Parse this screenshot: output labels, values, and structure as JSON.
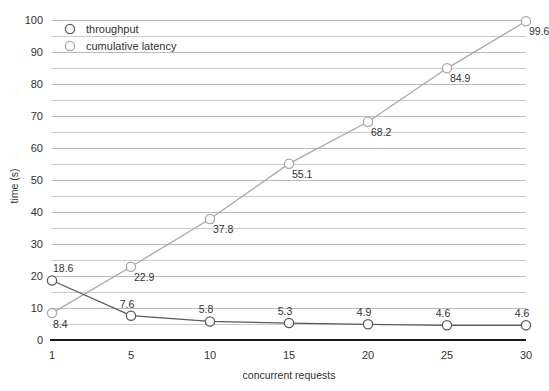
{
  "chart_data": {
    "type": "line",
    "title": "",
    "xlabel": "concurrent requests",
    "ylabel": "time (s)",
    "categories": [
      "1",
      "5",
      "10",
      "15",
      "20",
      "25",
      "30"
    ],
    "x": [
      1,
      5,
      10,
      15,
      20,
      25,
      30
    ],
    "ylim": [
      0,
      100
    ],
    "xlim": [
      1,
      30
    ],
    "y_ticks": [
      "0",
      "10",
      "20",
      "30",
      "40",
      "50",
      "60",
      "70",
      "80",
      "90",
      "100"
    ],
    "y_tick_values": [
      0,
      10,
      20,
      30,
      40,
      50,
      60,
      70,
      80,
      90,
      100
    ],
    "y_minor_step": 5,
    "grid": "horizontal",
    "legend_position": "top-left-inside",
    "series": [
      {
        "name": "throughput",
        "color": "#5a5a5a",
        "marker": "open-circle",
        "values": [
          18.6,
          7.6,
          5.8,
          5.3,
          4.9,
          4.6,
          4.6
        ],
        "labels": [
          "18.6",
          "7.6",
          "5.8",
          "5.3",
          "4.9",
          "4.6",
          "4.6"
        ]
      },
      {
        "name": "cumulative latency",
        "color": "#a8a8a8",
        "marker": "open-circle",
        "values": [
          8.4,
          22.9,
          37.8,
          55.1,
          68.2,
          84.9,
          99.6
        ],
        "labels": [
          "8.4",
          "22.9",
          "37.8",
          "55.1",
          "68.2",
          "84.9",
          "99.6"
        ]
      }
    ]
  },
  "legend": {
    "entries": [
      {
        "label": "throughput"
      },
      {
        "label": "cumulative latency"
      }
    ]
  },
  "axes": {
    "y_title": "time (s)",
    "x_title": "concurrent requests"
  },
  "colors": {
    "throughput": "#5a5a5a",
    "cumulative_latency": "#a8a8a8",
    "gridline": "#b5b5b5",
    "baseline": "#1a1a1a",
    "text": "#333333",
    "background": "#ffffff"
  }
}
